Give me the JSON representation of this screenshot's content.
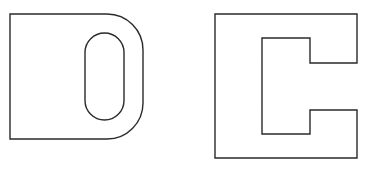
{
  "figure": {
    "stroke_color": "#2a2a2a",
    "background_color": "#ffffff",
    "shapes": [
      {
        "id": "d-shape",
        "label": "",
        "outer": {
          "left": 10,
          "top": 14,
          "right": 143,
          "bottom": 139,
          "corner_radius_right": 36
        },
        "inner_slot": {
          "left": 85,
          "top": 33,
          "right": 124,
          "bottom": 120
        }
      },
      {
        "id": "c-shape",
        "label": "",
        "outer": {
          "left": 215,
          "top": 14,
          "right": 357,
          "bottom": 158
        },
        "inner": {
          "left": 262,
          "top": 38,
          "step_x": 310,
          "bottom": 134,
          "notch_top": 63,
          "notch_bottom": 110
        }
      }
    ]
  }
}
